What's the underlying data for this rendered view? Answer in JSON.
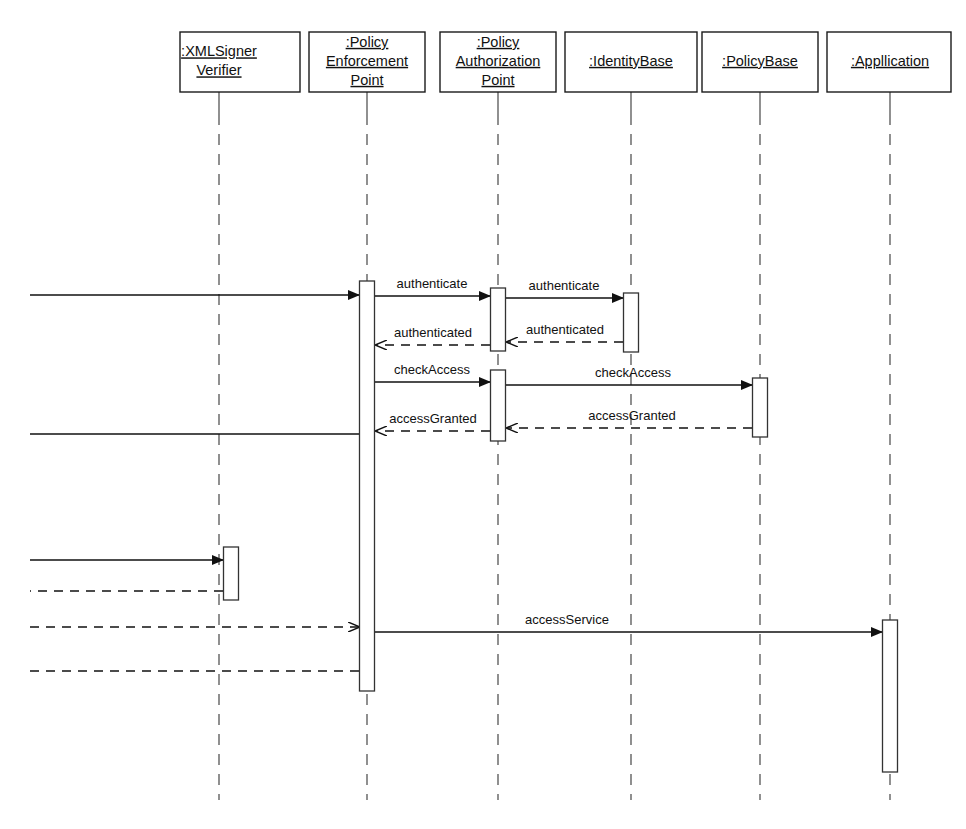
{
  "diagram": {
    "type": "uml-sequence-diagram",
    "title": "",
    "canvas": {
      "width": 966,
      "height": 829
    },
    "colors": {
      "background": "#ffffff",
      "stroke": "#111111",
      "lifeline": "#555555",
      "activation_fill": "#ffffff",
      "caption": "#c9c9c9"
    }
  },
  "participants": [
    {
      "id": "xmlsigner",
      "name": ":XMLSigner Verifier",
      "label_lines": [
        ":XMLSigner",
        "Verifier"
      ],
      "x": 219,
      "box": {
        "left": 180,
        "top": 32,
        "width": 120,
        "height": 60
      }
    },
    {
      "id": "pep",
      "name": ":Policy Enforcement Point",
      "label_lines": [
        ":Policy",
        "Enforcement",
        "Point"
      ],
      "x": 367,
      "box": {
        "left": 309,
        "top": 32,
        "width": 116,
        "height": 60
      }
    },
    {
      "id": "pap",
      "name": ":Policy Authorization Point",
      "label_lines": [
        ":Policy",
        "Authorization",
        "Point"
      ],
      "x": 498,
      "box": {
        "left": 440,
        "top": 32,
        "width": 116,
        "height": 60
      }
    },
    {
      "id": "identitybase",
      "name": ":IdentityBase",
      "label_lines": [
        ":IdentityBase"
      ],
      "x": 631,
      "box": {
        "left": 565,
        "top": 32,
        "width": 132,
        "height": 60
      }
    },
    {
      "id": "policybase",
      "name": ":PolicyBase",
      "label_lines": [
        ":PolicyBase"
      ],
      "x": 760,
      "box": {
        "left": 702,
        "top": 32,
        "width": 116,
        "height": 60
      }
    },
    {
      "id": "application",
      "name": ":Appllication",
      "label_lines": [
        ":Appllication"
      ],
      "x": 890,
      "box": {
        "left": 827,
        "top": 32,
        "width": 124,
        "height": 60
      }
    }
  ],
  "activations": [
    {
      "id": "act-pep-main",
      "participant": "pep",
      "x": 367,
      "top": 281,
      "bottom": 691,
      "width": 15
    },
    {
      "id": "act-pap-auth",
      "participant": "pap",
      "x": 498,
      "top": 288,
      "bottom": 351,
      "width": 15
    },
    {
      "id": "act-pap-check",
      "participant": "pap",
      "x": 498,
      "top": 370,
      "bottom": 441,
      "width": 15
    },
    {
      "id": "act-idb",
      "participant": "identitybase",
      "x": 631,
      "top": 293,
      "bottom": 352,
      "width": 15
    },
    {
      "id": "act-pdb",
      "participant": "policybase",
      "x": 760,
      "top": 378,
      "bottom": 437,
      "width": 15
    },
    {
      "id": "act-xml",
      "participant": "xmlsigner",
      "x": 231,
      "top": 547,
      "bottom": 600,
      "width": 15
    },
    {
      "id": "act-app",
      "participant": "application",
      "x": 890,
      "top": 620,
      "bottom": 772,
      "width": 15
    }
  ],
  "messages": [
    {
      "id": "msg-in-pep",
      "label": "",
      "style": "solid",
      "arrow": "filled",
      "from_x": 30,
      "to_x": 359,
      "y": 295,
      "label_x": 0
    },
    {
      "id": "msg-authenticate-1",
      "label": "authenticate",
      "style": "solid",
      "arrow": "filled",
      "from_x": 375,
      "to_x": 490,
      "y": 296,
      "label_x": 432
    },
    {
      "id": "msg-authenticate-2",
      "label": "authenticate",
      "style": "solid",
      "arrow": "filled",
      "from_x": 506,
      "to_x": 623,
      "y": 298,
      "label_x": 564
    },
    {
      "id": "msg-authenticated-1",
      "label": "authenticated",
      "style": "dashed",
      "arrow": "open",
      "from_x": 623,
      "to_x": 507,
      "y": 342,
      "label_x": 565
    },
    {
      "id": "msg-authenticated-2",
      "label": "authenticated",
      "style": "dashed",
      "arrow": "open",
      "from_x": 490,
      "to_x": 376,
      "y": 345,
      "label_x": 433
    },
    {
      "id": "msg-checkaccess-1",
      "label": "checkAccess",
      "style": "solid",
      "arrow": "filled",
      "from_x": 375,
      "to_x": 490,
      "y": 382,
      "label_x": 432
    },
    {
      "id": "msg-checkaccess-2",
      "label": "checkAccess",
      "style": "solid",
      "arrow": "filled",
      "from_x": 506,
      "to_x": 752,
      "y": 385,
      "label_x": 633
    },
    {
      "id": "msg-accessgranted-1",
      "label": "accessGranted",
      "style": "dashed",
      "arrow": "open",
      "from_x": 752,
      "to_x": 507,
      "y": 428,
      "label_x": 632
    },
    {
      "id": "msg-accessgranted-2",
      "label": "accessGranted",
      "style": "dashed",
      "arrow": "open",
      "from_x": 490,
      "to_x": 376,
      "y": 431,
      "label_x": 433
    },
    {
      "id": "msg-out-left-1",
      "label": "",
      "style": "solid",
      "arrow": "none",
      "from_x": 359,
      "to_x": 30,
      "y": 434,
      "label_x": 0
    },
    {
      "id": "msg-in-xmlsigner",
      "label": "",
      "style": "solid",
      "arrow": "filled",
      "from_x": 30,
      "to_x": 223,
      "y": 560,
      "label_x": 0
    },
    {
      "id": "msg-out-xmlsigner",
      "label": "",
      "style": "dashed",
      "arrow": "none",
      "from_x": 223,
      "to_x": 30,
      "y": 591,
      "label_x": 0
    },
    {
      "id": "msg-in-pep-dashed",
      "label": "",
      "style": "dashed",
      "arrow": "open",
      "from_x": 30,
      "to_x": 359,
      "y": 627,
      "label_x": 0
    },
    {
      "id": "msg-accessservice",
      "label": "accessService",
      "style": "solid",
      "arrow": "filled",
      "from_x": 375,
      "to_x": 882,
      "y": 632,
      "label_x": 567
    },
    {
      "id": "msg-out-left-2",
      "label": "",
      "style": "dashed",
      "arrow": "none",
      "from_x": 359,
      "to_x": 30,
      "y": 671,
      "label_x": 0
    }
  ],
  "caption": {
    "text": "",
    "x": 560,
    "y": 824
  }
}
